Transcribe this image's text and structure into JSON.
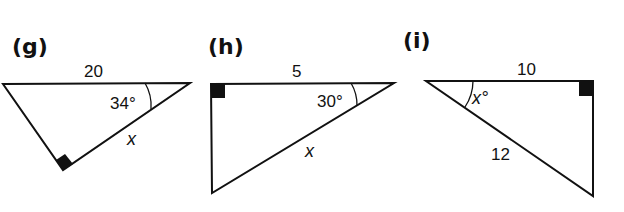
{
  "figures": [
    {
      "id": "g",
      "label": "(g)",
      "side_top": "20",
      "angle": "34°",
      "unknown": "x"
    },
    {
      "id": "h",
      "label": "(h)",
      "side_top": "5",
      "angle": "30°",
      "unknown": "x"
    },
    {
      "id": "i",
      "label": "(i)",
      "side_top": "10",
      "angle": "x°",
      "hypotenuse": "12"
    }
  ]
}
